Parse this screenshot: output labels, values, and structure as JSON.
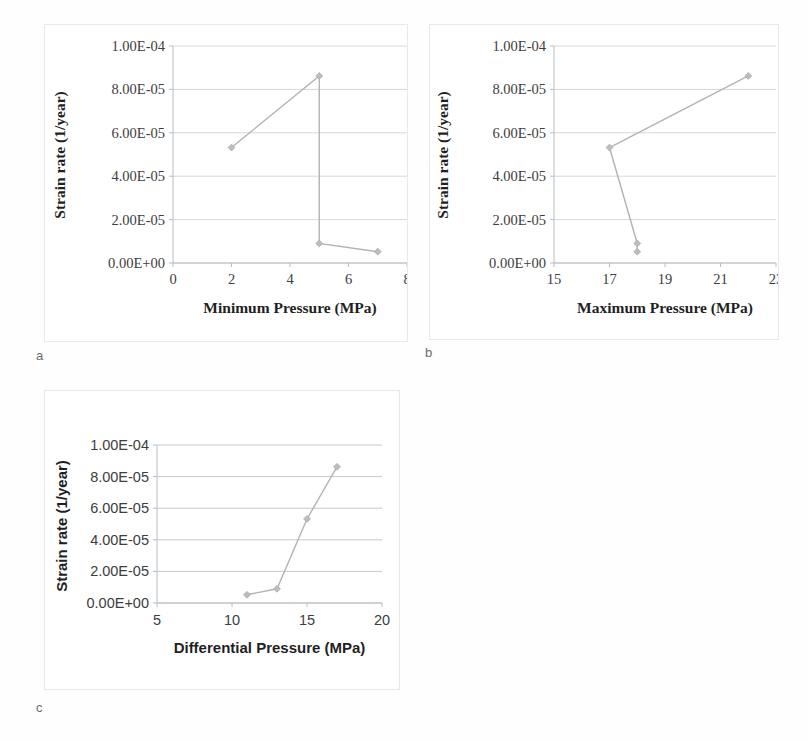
{
  "figure": {
    "panels": [
      {
        "key": "a",
        "label": "a"
      },
      {
        "key": "b",
        "label": "b"
      },
      {
        "key": "c",
        "label": "c"
      }
    ]
  },
  "chart_data": [
    {
      "panel": "a",
      "type": "line",
      "title": "",
      "xlabel": "Minimum  Pressure (MPa)",
      "ylabel": "Strain rate (1/year)",
      "xlim": [
        0,
        8
      ],
      "ylim": [
        0,
        0.0001
      ],
      "xticks": [
        0,
        2,
        4,
        6,
        8
      ],
      "xticklabels": [
        "0",
        "2",
        "4",
        "6",
        "8"
      ],
      "yticks": [
        0,
        2e-05,
        4e-05,
        6e-05,
        8e-05,
        0.0001
      ],
      "yticklabels": [
        "0.00E+00",
        "2.00E-05",
        "4.00E-05",
        "6.00E-05",
        "8.00E-05",
        "1.00E-04"
      ],
      "grid": true,
      "legend": "none",
      "marker": "diamond",
      "color": "#bdbdbd",
      "series": [
        {
          "name": "Strain rate",
          "points": [
            {
              "x": 2,
              "y": 5.32e-05
            },
            {
              "x": 5,
              "y": 8.62e-05
            },
            {
              "x": 5,
              "y": 9e-06
            },
            {
              "x": 7,
              "y": 5.2e-06
            }
          ]
        }
      ]
    },
    {
      "panel": "b",
      "type": "line",
      "title": "",
      "xlabel": "Maximum  Pressure (MPa)",
      "ylabel": "Strain rate (1/year)",
      "xlim": [
        15,
        23
      ],
      "ylim": [
        0,
        0.0001
      ],
      "xticks": [
        15,
        17,
        19,
        21,
        23
      ],
      "xticklabels": [
        "15",
        "17",
        "19",
        "21",
        "23"
      ],
      "yticks": [
        0,
        2e-05,
        4e-05,
        6e-05,
        8e-05,
        0.0001
      ],
      "yticklabels": [
        "0.00E+00",
        "2.00E-05",
        "4.00E-05",
        "6.00E-05",
        "8.00E-05",
        "1.00E-04"
      ],
      "grid": true,
      "legend": "none",
      "marker": "diamond",
      "color": "#bdbdbd",
      "series": [
        {
          "name": "Strain rate",
          "points": [
            {
              "x": 22,
              "y": 8.62e-05
            },
            {
              "x": 17,
              "y": 5.32e-05
            },
            {
              "x": 18,
              "y": 9e-06
            },
            {
              "x": 18,
              "y": 5.2e-06
            }
          ]
        }
      ]
    },
    {
      "panel": "c",
      "type": "line",
      "title": "",
      "xlabel": "Differential Pressure (MPa)",
      "ylabel": "Strain rate (1/year)",
      "xlim": [
        5,
        20
      ],
      "ylim": [
        0,
        0.0001
      ],
      "xticks": [
        5,
        10,
        15,
        20
      ],
      "xticklabels": [
        "5",
        "10",
        "15",
        "20"
      ],
      "yticks": [
        0,
        2e-05,
        4e-05,
        6e-05,
        8e-05,
        0.0001
      ],
      "yticklabels": [
        "0.00E+00",
        "2.00E-05",
        "4.00E-05",
        "6.00E-05",
        "8.00E-05",
        "1.00E-04"
      ],
      "grid": true,
      "legend": "none",
      "marker": "diamond",
      "color": "#bdbdbd",
      "series": [
        {
          "name": "Strain rate",
          "points": [
            {
              "x": 11,
              "y": 5.2e-06
            },
            {
              "x": 13,
              "y": 9e-06
            },
            {
              "x": 15,
              "y": 5.32e-05
            },
            {
              "x": 17,
              "y": 8.62e-05
            }
          ]
        }
      ]
    }
  ]
}
